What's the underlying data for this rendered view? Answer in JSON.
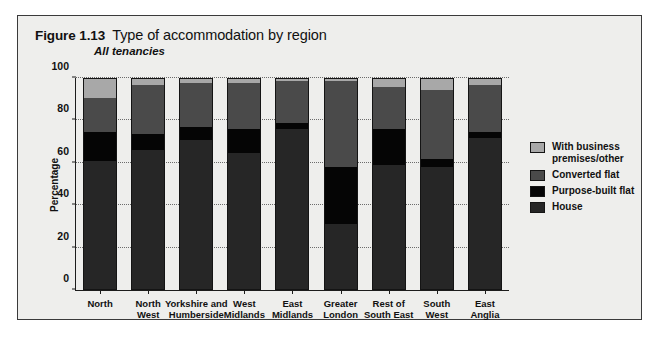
{
  "figure": {
    "number": "Figure 1.13",
    "title": "Type of accommodation by region",
    "subtitle": "All tenancies"
  },
  "colors": {
    "house": "#262626",
    "purpose_built_flat": "#050505",
    "converted_flat": "#4a4a4a",
    "with_business_premises_other": "#a8a8a8",
    "panel_background": "#eeeeec",
    "axis": "#1c1c1c"
  },
  "chart_data": {
    "type": "bar",
    "stacked": true,
    "title": "Type of accommodation by region",
    "subtitle": "All tenancies",
    "xlabel": "",
    "ylabel": "Percentage",
    "ylim": [
      0,
      100
    ],
    "yticks": [
      0,
      20,
      40,
      60,
      80,
      100
    ],
    "grid": true,
    "legend_position": "right",
    "categories": [
      "North",
      "North\nWest",
      "Yorkshire and\nHumberside",
      "West\nMidlands",
      "East\nMidlands",
      "Greater\nLondon",
      "Rest of\nSouth East",
      "South\nWest",
      "East\nAnglia"
    ],
    "series": [
      {
        "name": "House",
        "color": "#262626",
        "values": [
          61,
          66,
          71,
          65,
          76,
          31,
          59,
          58,
          72
        ]
      },
      {
        "name": "Purpose-built flat",
        "color": "#050505",
        "values": [
          14,
          8,
          6,
          11,
          3,
          27,
          17,
          4,
          3
        ]
      },
      {
        "name": "Converted flat",
        "color": "#4a4a4a",
        "values": [
          16,
          23,
          21,
          22,
          20,
          41,
          20,
          33,
          22
        ]
      },
      {
        "name": "With business premises/other",
        "color": "#a8a8a8",
        "values": [
          9,
          3,
          2,
          2,
          1,
          1,
          4,
          5,
          3
        ]
      }
    ]
  },
  "legend": {
    "items": [
      {
        "label": "With business\npremises/other",
        "color": "#a8a8a8"
      },
      {
        "label": "Converted flat",
        "color": "#4a4a4a"
      },
      {
        "label": "Purpose-built flat",
        "color": "#050505"
      },
      {
        "label": "House",
        "color": "#262626"
      }
    ]
  }
}
